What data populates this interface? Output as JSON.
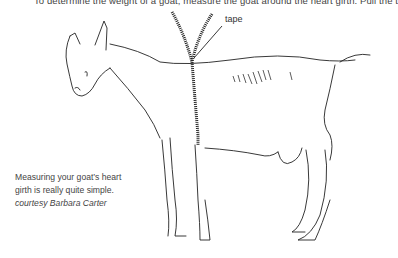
{
  "instruction_text": "To determine the weight of a goat, measure the goat around the heart girth. Pull the t",
  "illustration": {
    "subject": "goat-heart-girth-measurement",
    "tape_label": "tape"
  },
  "caption": {
    "line1": "Measuring your goat’s heart",
    "line2": "girth is really quite simple.",
    "credit": "courtesy Barbara Carter"
  }
}
